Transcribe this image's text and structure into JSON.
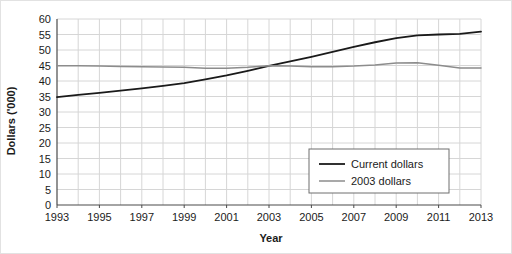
{
  "chart_data": {
    "type": "line",
    "title": "",
    "xlabel": "Year",
    "ylabel": "Dollars ('000)",
    "xlim": [
      1993,
      2013
    ],
    "ylim": [
      0,
      60
    ],
    "grid": true,
    "legend_position": "inside-bottom-right",
    "y_ticks": [
      0,
      5,
      10,
      15,
      20,
      25,
      30,
      35,
      40,
      45,
      50,
      55,
      60
    ],
    "y_tick_labels": [
      "0",
      "5",
      "10",
      "15",
      "20",
      "25",
      "30",
      "35",
      "40",
      "45",
      "50",
      "55",
      "60"
    ],
    "x_ticks": [
      1993,
      1995,
      1997,
      1999,
      2001,
      2003,
      2005,
      2007,
      2009,
      2011,
      2013
    ],
    "x_tick_labels": [
      "1993",
      "1995",
      "1997",
      "1999",
      "2001",
      "2003",
      "2005",
      "2007",
      "2009",
      "2011",
      "2013"
    ],
    "x_minor_ticks": [
      1994,
      1996,
      1998,
      2000,
      2002,
      2004,
      2006,
      2008,
      2010,
      2012
    ],
    "x": [
      1993,
      1994,
      1995,
      1996,
      1997,
      1998,
      1999,
      2000,
      2001,
      2002,
      2003,
      2004,
      2005,
      2006,
      2007,
      2008,
      2009,
      2010,
      2011,
      2012,
      2013
    ],
    "series": [
      {
        "name": "Current dollars",
        "color": "#1a1a1a",
        "width": 1.8,
        "values": [
          34.8,
          35.5,
          36.2,
          36.9,
          37.6,
          38.4,
          39.3,
          40.5,
          41.8,
          43.3,
          44.9,
          46.3,
          47.8,
          49.4,
          51.0,
          52.5,
          53.8,
          54.7,
          55.0,
          55.2,
          55.9
        ]
      },
      {
        "name": "2003 dollars",
        "color": "#8c8c8c",
        "width": 1.5,
        "values": [
          44.9,
          44.9,
          44.8,
          44.7,
          44.6,
          44.5,
          44.4,
          44.1,
          44.1,
          44.4,
          44.9,
          44.8,
          44.6,
          44.6,
          44.8,
          45.2,
          45.8,
          45.9,
          45.1,
          44.2,
          44.2
        ]
      }
    ],
    "legend": [
      {
        "label": "Current dollars",
        "color": "#1a1a1a"
      },
      {
        "label": "2003 dollars",
        "color": "#8c8c8c"
      }
    ]
  }
}
